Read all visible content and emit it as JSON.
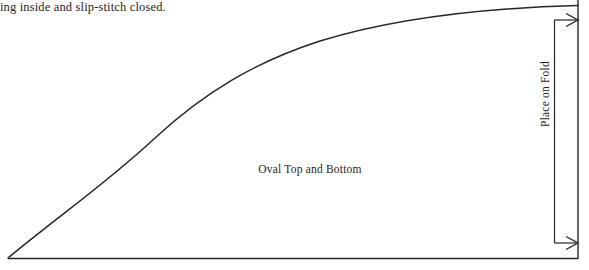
{
  "document": {
    "type": "sewing-pattern-diagram",
    "background_color": "#ffffff",
    "ink_color": "#262626",
    "width": 589,
    "height": 270
  },
  "instruction_text": {
    "line": "ing inside and slip-stitch closed."
  },
  "pattern": {
    "piece_label": "Oval Top and Bottom",
    "fold_label": "Place on Fold"
  },
  "markings": {
    "curve_name": "quarter-oval-cutting-line",
    "baseline_name": "bottom-straight-edge",
    "fold_line_name": "right-fold-edge",
    "bracket_name": "place-on-fold-bracket",
    "arrow_top_name": "fold-arrow-top",
    "arrow_bottom_name": "fold-arrow-bottom"
  }
}
